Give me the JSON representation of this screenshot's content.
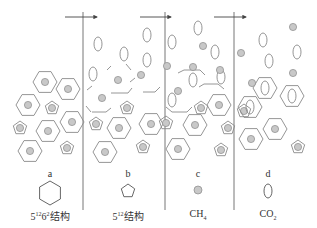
{
  "colors": {
    "stroke": "#8a8a8a",
    "fill_dot": "#c8c8c8",
    "text": "#333333"
  },
  "dividers": [
    83,
    165,
    234
  ],
  "arrows": [
    {
      "x1": 65,
      "x2": 97,
      "y": 17
    },
    {
      "x1": 140,
      "x2": 171,
      "y": 17
    },
    {
      "x1": 214,
      "x2": 246,
      "y": 17
    }
  ],
  "panels": [
    {
      "id": "a",
      "label": "a",
      "label_x": 50,
      "caption_base": "5",
      "caption_sup": "12",
      "caption_mid": "6",
      "caption_sup2": "2",
      "caption_tail": "结构",
      "caption_x": 50,
      "legend": "hexagon"
    },
    {
      "id": "b",
      "label": "b",
      "label_x": 128,
      "caption_base": "5",
      "caption_sup": "12",
      "caption_tail": "结构",
      "caption_x": 128,
      "legend": "pentagon"
    },
    {
      "id": "c",
      "label": "c",
      "label_x": 198,
      "caption_base": "CH",
      "caption_sub": "4",
      "caption_x": 198,
      "legend": "dot"
    },
    {
      "id": "d",
      "label": "d",
      "label_x": 268,
      "caption_base": "CO",
      "caption_sub": "2",
      "caption_x": 268,
      "legend": "ellipse"
    }
  ],
  "legend_positions": {
    "hexagon": {
      "cx": 50,
      "cy": 193,
      "r": 12
    },
    "pentagon": {
      "cx": 128,
      "cy": 191,
      "r": 7
    },
    "dot": {
      "cx": 198,
      "cy": 190,
      "r": 4
    },
    "ellipse": {
      "cx": 268,
      "cy": 191,
      "rx": 4,
      "ry": 7
    }
  },
  "shapes": {
    "hex_dot": [
      [
        45,
        82
      ],
      [
        68,
        89
      ],
      [
        28,
        105
      ],
      [
        72,
        122
      ],
      [
        48,
        131
      ],
      [
        30,
        151
      ],
      [
        119,
        128
      ],
      [
        151,
        124
      ],
      [
        105,
        152
      ],
      [
        195,
        125
      ],
      [
        219,
        105
      ],
      [
        178,
        149
      ],
      [
        251,
        139
      ],
      [
        275,
        129
      ]
    ],
    "pent_dot": [
      [
        52,
        108
      ],
      [
        20,
        128
      ],
      [
        67,
        148
      ],
      [
        127,
        108
      ],
      [
        96,
        124
      ],
      [
        143,
        147
      ],
      [
        201,
        108
      ],
      [
        166,
        123
      ],
      [
        221,
        150
      ],
      [
        228,
        128
      ],
      [
        244,
        111
      ],
      [
        298,
        147
      ]
    ],
    "hex_ellipse": [
      [
        265,
        88
      ],
      [
        292,
        96
      ],
      [
        250,
        107
      ]
    ],
    "ellipses": [
      [
        98,
        44
      ],
      [
        124,
        54
      ],
      [
        147,
        35
      ],
      [
        147,
        60
      ],
      [
        93,
        74
      ],
      [
        172,
        42
      ],
      [
        198,
        28
      ],
      [
        193,
        80
      ],
      [
        215,
        52
      ],
      [
        221,
        77
      ],
      [
        172,
        100
      ],
      [
        263,
        40
      ],
      [
        269,
        61
      ],
      [
        297,
        52
      ]
    ],
    "dots": [
      [
        118,
        80
      ],
      [
        102,
        98
      ],
      [
        141,
        75
      ],
      [
        167,
        66
      ],
      [
        178,
        91
      ],
      [
        220,
        70
      ],
      [
        193,
        67
      ],
      [
        203,
        46
      ],
      [
        241,
        53
      ],
      [
        252,
        83
      ],
      [
        293,
        27
      ],
      [
        293,
        73
      ]
    ],
    "broken_cages": [
      {
        "type": "full",
        "cx": 120,
        "cy": 83
      },
      {
        "type": "left",
        "cx": 101,
        "cy": 100
      },
      {
        "type": "right",
        "cx": 146,
        "cy": 83
      },
      {
        "type": "left-b",
        "cx": 96,
        "cy": 106
      },
      {
        "type": "c1",
        "cx": 192,
        "cy": 78
      },
      {
        "type": "c2",
        "cx": 214,
        "cy": 90
      },
      {
        "type": "c3",
        "cx": 173,
        "cy": 110
      }
    ]
  }
}
